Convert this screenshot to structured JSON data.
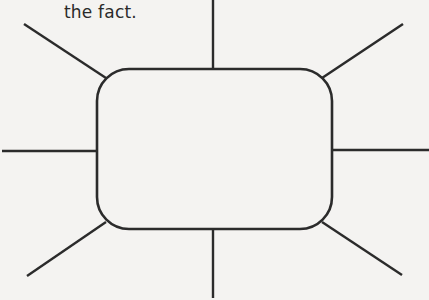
{
  "caption": {
    "text": "the fact."
  },
  "diagram": {
    "type": "spider-map",
    "center_box": {
      "x": 97,
      "y": 69,
      "width": 235,
      "height": 160,
      "radius": 32,
      "label": ""
    },
    "stroke_color": "#2b2b2b",
    "background_color": "#f4f3f1",
    "spokes": [
      {
        "name": "top",
        "x1": 213,
        "y1": 0,
        "x2": 213,
        "y2": 69
      },
      {
        "name": "top-right",
        "x1": 322,
        "y1": 78,
        "x2": 403,
        "y2": 24
      },
      {
        "name": "right",
        "x1": 332,
        "y1": 150,
        "x2": 429,
        "y2": 150
      },
      {
        "name": "bottom-right",
        "x1": 322,
        "y1": 222,
        "x2": 402,
        "y2": 275
      },
      {
        "name": "bottom",
        "x1": 213,
        "y1": 229,
        "x2": 213,
        "y2": 298
      },
      {
        "name": "bottom-left",
        "x1": 106,
        "y1": 222,
        "x2": 27,
        "y2": 276
      },
      {
        "name": "left",
        "x1": 2,
        "y1": 151,
        "x2": 97,
        "y2": 151
      },
      {
        "name": "top-left",
        "x1": 106,
        "y1": 78,
        "x2": 24,
        "y2": 24
      }
    ]
  }
}
